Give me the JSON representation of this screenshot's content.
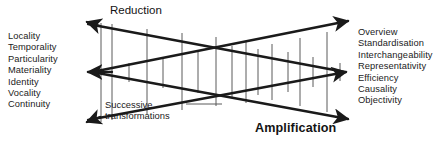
{
  "figure": {
    "labels": {
      "reduction": "Reduction",
      "amplification": "Amplification",
      "successive_line1": "Successive",
      "successive_line2": "transformations"
    },
    "left_terms": [
      "Locality",
      "Temporality",
      "Particularity",
      "Materiality",
      "Identity",
      "Vocality",
      "Continuity"
    ],
    "right_terms": [
      "Overview",
      "Standardisation",
      "Interchangeability",
      "Representativity",
      "Efficiency",
      "Causality",
      "Objectivity"
    ],
    "colors": {
      "background": "#ffffff",
      "stroke_heavy": "#1a1a1a",
      "stroke_light": "#5a5a5a",
      "text": "#1b1b1b"
    },
    "arrows": [
      {
        "name": "reduction-arrow-top-left",
        "direction": "up-left",
        "x": 84,
        "y": 21
      },
      {
        "name": "convergence-arrow-middle-left",
        "direction": "left",
        "x": 88,
        "y": 72
      },
      {
        "name": "amplification-arrow-bottom-left",
        "direction": "down-left",
        "x": 84,
        "y": 123
      },
      {
        "name": "reduction-arrow-top-right",
        "direction": "up-right",
        "x": 352,
        "y": 18
      },
      {
        "name": "convergence-arrow-middle-right",
        "direction": "right",
        "x": 350,
        "y": 72
      },
      {
        "name": "amplification-arrow-bottom-right",
        "direction": "down-right",
        "x": 352,
        "y": 120
      }
    ]
  }
}
